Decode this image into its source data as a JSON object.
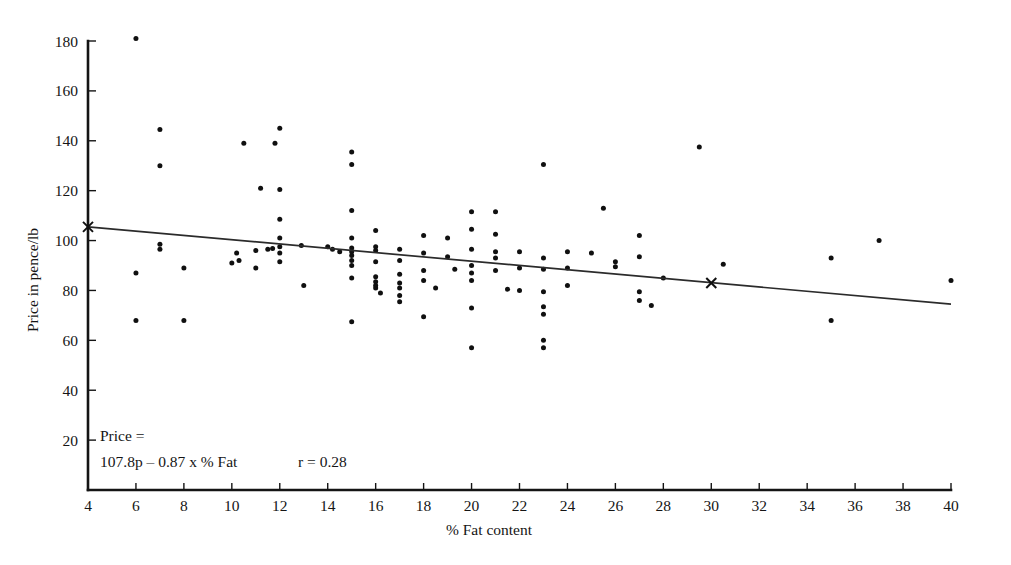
{
  "chart_data": {
    "type": "scatter",
    "title": "",
    "xlabel": "% Fat content",
    "ylabel": "Price in pence/lb",
    "xlim": [
      4,
      40
    ],
    "ylim": [
      0,
      180
    ],
    "xticks": [
      4,
      6,
      8,
      10,
      12,
      14,
      16,
      18,
      20,
      22,
      24,
      26,
      28,
      30,
      32,
      34,
      36,
      38,
      40
    ],
    "yticks": [
      20,
      40,
      60,
      80,
      100,
      120,
      140,
      160,
      180
    ],
    "grid": false,
    "legend": null,
    "annotations": {
      "equation_line1": "Price =",
      "equation_line2": "107.8p – 0.87 x % Fat",
      "correlation": "r = 0.28"
    },
    "regression": {
      "intercept": 107.8,
      "slope": -0.87,
      "r": 0.28,
      "x_start": 4,
      "y_start": 105.5,
      "x_end": 40,
      "y_end": 74.5,
      "endpoint_markers": [
        {
          "x": 4,
          "y": 105.5,
          "marker": "x"
        },
        {
          "x": 30,
          "y": 83.0,
          "marker": "x"
        }
      ]
    },
    "points": [
      [
        6.0,
        181.0
      ],
      [
        7.0,
        144.5
      ],
      [
        7.0,
        130.0
      ],
      [
        6.0,
        87.0
      ],
      [
        7.0,
        98.5
      ],
      [
        7.0,
        96.5
      ],
      [
        6.0,
        68.0
      ],
      [
        8.0,
        89.0
      ],
      [
        8.0,
        68.0
      ],
      [
        10.5,
        139.0
      ],
      [
        11.8,
        139.0
      ],
      [
        12.0,
        145.0
      ],
      [
        11.2,
        121.0
      ],
      [
        12.0,
        120.5
      ],
      [
        12.0,
        108.5
      ],
      [
        10.2,
        95.0
      ],
      [
        10.3,
        92.0
      ],
      [
        10.0,
        91.0
      ],
      [
        11.0,
        96.0
      ],
      [
        11.5,
        96.5
      ],
      [
        11.7,
        96.8
      ],
      [
        12.0,
        101.0
      ],
      [
        12.0,
        97.5
      ],
      [
        12.0,
        95.0
      ],
      [
        12.0,
        91.5
      ],
      [
        11.0,
        89.0
      ],
      [
        12.9,
        98.0
      ],
      [
        13.0,
        82.0
      ],
      [
        14.0,
        97.5
      ],
      [
        15.0,
        135.5
      ],
      [
        15.0,
        130.5
      ],
      [
        15.0,
        112.0
      ],
      [
        15.0,
        101.0
      ],
      [
        15.0,
        97.0
      ],
      [
        15.0,
        95.5
      ],
      [
        15.0,
        94.0
      ],
      [
        15.0,
        92.0
      ],
      [
        15.0,
        90.0
      ],
      [
        15.0,
        85.0
      ],
      [
        15.0,
        67.5
      ],
      [
        14.2,
        96.5
      ],
      [
        14.5,
        95.5
      ],
      [
        16.0,
        104.0
      ],
      [
        16.0,
        97.5
      ],
      [
        16.0,
        96.0
      ],
      [
        16.0,
        91.5
      ],
      [
        16.0,
        85.5
      ],
      [
        16.0,
        83.5
      ],
      [
        16.0,
        82.0
      ],
      [
        16.0,
        81.0
      ],
      [
        16.2,
        79.0
      ],
      [
        17.0,
        96.5
      ],
      [
        17.0,
        92.0
      ],
      [
        17.0,
        86.5
      ],
      [
        17.0,
        83.0
      ],
      [
        17.0,
        81.0
      ],
      [
        17.0,
        78.0
      ],
      [
        17.0,
        75.5
      ],
      [
        18.0,
        102.0
      ],
      [
        18.0,
        95.0
      ],
      [
        18.0,
        88.0
      ],
      [
        18.0,
        84.0
      ],
      [
        18.5,
        81.0
      ],
      [
        18.0,
        69.5
      ],
      [
        19.0,
        101.0
      ],
      [
        19.0,
        93.5
      ],
      [
        19.3,
        88.5
      ],
      [
        20.0,
        111.5
      ],
      [
        20.0,
        104.5
      ],
      [
        20.0,
        96.5
      ],
      [
        20.0,
        90.0
      ],
      [
        20.0,
        87.0
      ],
      [
        20.0,
        84.0
      ],
      [
        20.0,
        73.0
      ],
      [
        20.0,
        57.0
      ],
      [
        21.0,
        111.5
      ],
      [
        21.0,
        102.5
      ],
      [
        21.0,
        95.5
      ],
      [
        21.0,
        93.0
      ],
      [
        21.0,
        88.0
      ],
      [
        21.5,
        80.5
      ],
      [
        22.0,
        95.5
      ],
      [
        22.0,
        89.0
      ],
      [
        22.0,
        80.0
      ],
      [
        23.0,
        130.5
      ],
      [
        23.0,
        93.0
      ],
      [
        23.0,
        88.5
      ],
      [
        23.0,
        79.5
      ],
      [
        23.0,
        73.5
      ],
      [
        23.0,
        70.5
      ],
      [
        23.0,
        60.0
      ],
      [
        23.0,
        57.0
      ],
      [
        24.0,
        95.5
      ],
      [
        24.0,
        89.0
      ],
      [
        24.0,
        82.0
      ],
      [
        25.0,
        95.0
      ],
      [
        25.5,
        113.0
      ],
      [
        26.0,
        91.5
      ],
      [
        26.0,
        89.5
      ],
      [
        27.0,
        102.0
      ],
      [
        27.0,
        93.5
      ],
      [
        27.0,
        79.5
      ],
      [
        27.0,
        76.0
      ],
      [
        27.5,
        74.0
      ],
      [
        28.0,
        85.0
      ],
      [
        29.5,
        137.5
      ],
      [
        30.5,
        90.5
      ],
      [
        35.0,
        93.0
      ],
      [
        35.0,
        68.0
      ],
      [
        37.0,
        100.0
      ],
      [
        40.0,
        84.0
      ]
    ]
  },
  "axis": {
    "x_ticks_text": [
      "4",
      "6",
      "8",
      "10",
      "12",
      "14",
      "16",
      "18",
      "20",
      "22",
      "24",
      "26",
      "28",
      "30",
      "32",
      "34",
      "36",
      "38",
      "40"
    ],
    "y_ticks_text": [
      "20",
      "40",
      "60",
      "80",
      "100",
      "120",
      "140",
      "160",
      "180"
    ]
  }
}
